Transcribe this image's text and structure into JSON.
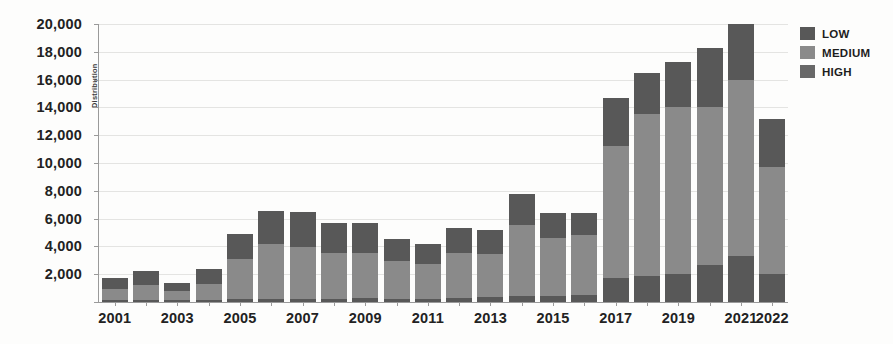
{
  "chart_data": {
    "type": "bar",
    "stacked": true,
    "title": "",
    "xlabel": "",
    "ylabel": "Distribution",
    "ylim": [
      0,
      20000
    ],
    "ytick_values": [
      0,
      2000,
      4000,
      6000,
      8000,
      10000,
      12000,
      14000,
      16000,
      18000,
      20000
    ],
    "ytick_labels": [
      "",
      "2,000",
      "4,000",
      "6,000",
      "8,000",
      "10,000",
      "12,000",
      "14,000",
      "16,000",
      "18,000",
      "20,000"
    ],
    "grid": true,
    "legend_position": "right",
    "categories": [
      "2001",
      "2002",
      "2003",
      "2004",
      "2005",
      "2006",
      "2007",
      "2008",
      "2009",
      "2010",
      "2011",
      "2012",
      "2013",
      "2014",
      "2015",
      "2016",
      "2017",
      "2018",
      "2019",
      "2020",
      "2021",
      "2022"
    ],
    "xtick_labels_shown": [
      "2001",
      "2003",
      "2005",
      "2007",
      "2009",
      "2011",
      "2013",
      "2015",
      "2017",
      "2019",
      "2021",
      "2022"
    ],
    "series": [
      {
        "name": "LOW",
        "color": "#585858",
        "values": [
          130,
          140,
          110,
          150,
          200,
          230,
          250,
          250,
          260,
          250,
          230,
          280,
          330,
          420,
          430,
          520,
          1700,
          1850,
          2000,
          2650,
          3300,
          2000
        ]
      },
      {
        "name": "MEDIUM",
        "color": "#8a8a8a",
        "values": [
          800,
          1050,
          700,
          1150,
          2900,
          3950,
          3700,
          3250,
          3250,
          2700,
          2500,
          3250,
          3100,
          5150,
          4200,
          4300,
          9500,
          11650,
          12000,
          11350,
          12700,
          7700
        ]
      },
      {
        "name": "HIGH",
        "color": "#585858",
        "values": [
          770,
          1010,
          590,
          1100,
          1800,
          2400,
          2550,
          2200,
          2190,
          1550,
          1470,
          1770,
          1770,
          2230,
          1770,
          1580,
          3500,
          3000,
          3300,
          4300,
          4000,
          3500
        ]
      }
    ],
    "totals": [
      1700,
      2200,
      1400,
      2400,
      4900,
      6580,
      6500,
      5700,
      5700,
      4500,
      4200,
      5300,
      5200,
      7800,
      6400,
      6400,
      14700,
      16500,
      17300,
      18300,
      20000,
      13200
    ]
  },
  "legend": {
    "items": [
      {
        "label": "LOW",
        "color": "#585858"
      },
      {
        "label": "MEDIUM",
        "color": "#8a8a8a"
      },
      {
        "label": "HIGH",
        "color": "#686868"
      }
    ]
  }
}
